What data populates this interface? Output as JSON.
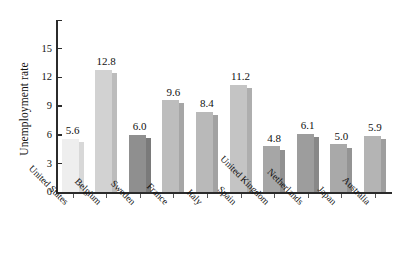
{
  "chart_data": {
    "type": "bar",
    "title": "",
    "xlabel": "",
    "ylabel": "Unemployment rate",
    "ylim": [
      0,
      16
    ],
    "grid": false,
    "legend": "none",
    "y_ticks": [
      "0",
      "3",
      "6",
      "9",
      "12",
      "15"
    ],
    "y_tick_values": [
      0,
      3,
      6,
      9,
      12,
      15
    ],
    "categories": [
      "United States",
      "Belgium",
      "Sweden",
      "France",
      "Italy",
      "Spain",
      "United Kingdom",
      "Netherlands",
      "Japan",
      "Australia"
    ],
    "values": [
      5.6,
      12.8,
      6.0,
      9.6,
      8.4,
      11.2,
      4.8,
      6.1,
      5.0,
      5.9
    ],
    "value_labels": [
      "5.6",
      "12.8",
      "6.0",
      "9.6",
      "8.4",
      "11.2",
      "4.8",
      "6.1",
      "5.0",
      "5.9"
    ],
    "bar_face_colors": [
      "#eeeeee",
      "#d2d2d2",
      "#8f8f8f",
      "#bdbdbd",
      "#b9b9b9",
      "#c4c4c4",
      "#a6a6a6",
      "#9d9d9d",
      "#a9a9a9",
      "#b4b4b4"
    ],
    "bar_side_colors": [
      "#d8d8d8",
      "#bcbcbc",
      "#7a7a7a",
      "#a6a6a6",
      "#a2a2a2",
      "#aeaeae",
      "#919191",
      "#888888",
      "#949494",
      "#9e9e9e"
    ]
  },
  "axis": {
    "axis_color": "#2b2b2b",
    "background": "#ffffff"
  }
}
